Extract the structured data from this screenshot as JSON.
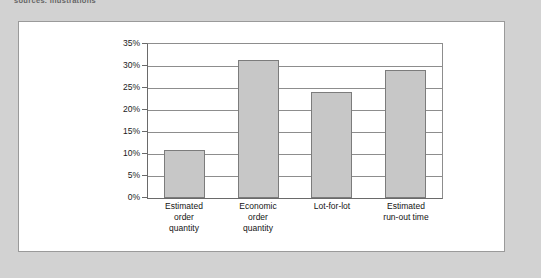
{
  "page": {
    "top_caption": "sources, illustrations",
    "background_color": "#d2d2d2",
    "card_background": "#ffffff",
    "card_border_color": "#9a9a9a"
  },
  "chart_data": {
    "type": "bar",
    "title": "",
    "subtitle": "",
    "xlabel": "",
    "ylabel": "",
    "categories": [
      "Estimated order quantity",
      "Economic order quantity",
      "Lot-for-lot",
      "Estimated run-out time"
    ],
    "category_lines": [
      [
        "Estimated",
        "order",
        "quantity"
      ],
      [
        "Economic",
        "order",
        "quantity"
      ],
      [
        "Lot-for-lot"
      ],
      [
        "Estimated",
        "run-out time"
      ]
    ],
    "values": [
      10.8,
      31.3,
      24.0,
      29.0
    ],
    "value_labels": [
      "10.8%",
      "31.3%",
      "24.0%",
      "29.0%"
    ],
    "ylim": [
      0,
      35
    ],
    "ytick_step": 5,
    "ytick_labels": [
      "0%",
      "5%",
      "10%",
      "15%",
      "20%",
      "25%",
      "30%",
      "35%"
    ],
    "ytick_values": [
      0,
      5,
      10,
      15,
      20,
      25,
      30,
      35
    ],
    "grid": true,
    "grid_orientation": "horizontal",
    "legend": false,
    "legend_position": "none",
    "bar_fill_color": "#c7c7c7",
    "bar_border_color": "#7c7c7c",
    "axis_color": "#6a6a6a",
    "gridline_color": "#8d8d8d"
  }
}
